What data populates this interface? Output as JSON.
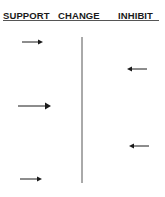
{
  "header": {
    "columns": [
      {
        "key": "support",
        "label": "SUPPORT"
      },
      {
        "key": "change",
        "label": "CHANGE"
      },
      {
        "key": "inhibit",
        "label": "INHIBIT"
      }
    ]
  },
  "arrows": [
    {
      "side": "support",
      "direction": "right",
      "strength": "normal"
    },
    {
      "side": "inhibit",
      "direction": "left",
      "strength": "normal"
    },
    {
      "side": "support",
      "direction": "right",
      "strength": "strong"
    },
    {
      "side": "inhibit",
      "direction": "left",
      "strength": "normal"
    },
    {
      "side": "support",
      "direction": "right",
      "strength": "normal"
    }
  ],
  "colors": {
    "ink": "#1a1a1a",
    "line": "#555555"
  }
}
